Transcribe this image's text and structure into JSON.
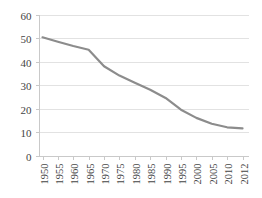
{
  "chart_data": {
    "type": "line",
    "title": "",
    "xlabel": "",
    "ylabel": "",
    "ylim": [
      0,
      60
    ],
    "ytick_step": 10,
    "yticks": [
      "0",
      "10",
      "20",
      "30",
      "40",
      "50",
      "60"
    ],
    "grid": true,
    "legend": "none",
    "line_color": "#8c8c8c",
    "categories": [
      "1950",
      "1955",
      "1960",
      "1965",
      "1970",
      "1975",
      "1980",
      "1985",
      "1990",
      "1995",
      "2000",
      "2005",
      "2010",
      "2012"
    ],
    "series": [
      {
        "name": "rate",
        "values": [
          50.3,
          48.4,
          46.6,
          45.0,
          38.0,
          34.0,
          31.0,
          28.0,
          24.5,
          19.5,
          16.0,
          13.5,
          12.0,
          11.5
        ]
      }
    ]
  },
  "axes": {
    "y_tick_labels": [
      "60",
      "50",
      "40",
      "30",
      "20",
      "10",
      "0"
    ],
    "x_tick_labels": [
      "1950",
      "1955",
      "1960",
      "1965",
      "1970",
      "1975",
      "1980",
      "1985",
      "1990",
      "1995",
      "2000",
      "2005",
      "2010",
      "2012"
    ]
  },
  "colors": {
    "line": "#8c8c8c",
    "grid": "#e2e2e2",
    "axis": "#c9c9c9",
    "text": "#444444",
    "background": "#ffffff"
  }
}
